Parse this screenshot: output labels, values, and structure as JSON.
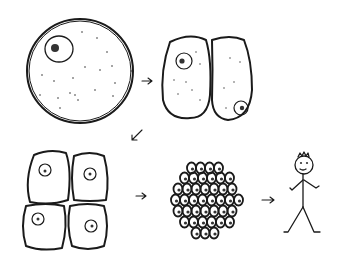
{
  "diagram": {
    "title": "",
    "stages": [
      {
        "id": "zygote",
        "label": "",
        "cells": 1
      },
      {
        "id": "two-cell",
        "label": "",
        "cells": 2
      },
      {
        "id": "four-cell",
        "label": "",
        "cells": 4
      },
      {
        "id": "morula",
        "label": "",
        "cells": 40
      },
      {
        "id": "human",
        "label": "",
        "cells": null
      }
    ],
    "arrows": [
      {
        "from": "zygote",
        "to": "two-cell"
      },
      {
        "from": "two-cell",
        "to": "four-cell"
      },
      {
        "from": "four-cell",
        "to": "morula"
      },
      {
        "from": "morula",
        "to": "human"
      }
    ],
    "style": "hand-drawn black ink on white",
    "colors": {
      "ink": "#1a1a1a",
      "background": "#ffffff"
    }
  }
}
